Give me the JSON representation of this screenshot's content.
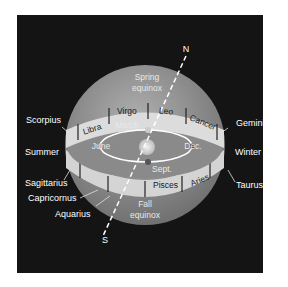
{
  "diagram": {
    "axis": {
      "north_label": "N",
      "south_label": "S"
    },
    "sphere_labels": {
      "spring_equinox_line1": "Spring",
      "spring_equinox_line2": "equinox",
      "fall_equinox_line1": "Fall",
      "fall_equinox_line2": "equinox"
    },
    "orbit_labels": {
      "march": "March",
      "june": "June",
      "sept": "Sept.",
      "dec": "Dec."
    },
    "zodiac_band_front": [
      "Libra",
      "Virgo",
      "Leo",
      "Cancer"
    ],
    "zodiac_band_back": [
      "Pisces",
      "Aries"
    ],
    "outside_labels": {
      "scorpius": "Scorpius",
      "summer": "Summer",
      "sagittarius": "Sagittarius",
      "capricornus": "Capricornus",
      "aquarius": "Aquarius",
      "gemini": "Gemini",
      "winter": "Winter",
      "taurus": "Taurus"
    },
    "colors": {
      "background": "#141414",
      "sphere": "#9a9a9a",
      "band": "#dcdcdc",
      "orbit": "#ffffff",
      "sun": "#d8d8d8",
      "text": "#ffffff"
    }
  }
}
